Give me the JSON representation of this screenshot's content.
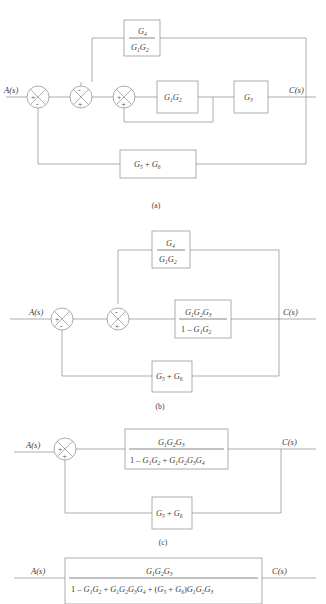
{
  "figure": {
    "title_cut": "",
    "panels": [
      {
        "id": "a",
        "caption": "(a)",
        "input_label": "A(s)",
        "output_label": "C(s)",
        "blocks": [
          {
            "name": "feedforward-ratio-block",
            "numerator": "G4",
            "denominator": "G1G2",
            "type": "fraction"
          },
          {
            "name": "g1g2-block",
            "text": "G1G2",
            "type": "plain"
          },
          {
            "name": "g3-block",
            "text": "G3",
            "type": "plain"
          },
          {
            "name": "g5g6-block",
            "text": "G5 + G6",
            "type": "plain"
          }
        ],
        "summers": [
          {
            "name": "summer-1",
            "left": "+",
            "bottom": "-"
          },
          {
            "name": "summer-2",
            "top": "-",
            "bottom": "+"
          },
          {
            "name": "summer-3",
            "left": "+",
            "bottom": "+"
          }
        ]
      },
      {
        "id": "b",
        "caption": "(b)",
        "input_label": "A(s)",
        "output_label": "C(s)",
        "blocks": [
          {
            "name": "feedforward-ratio-block",
            "numerator": "G4",
            "denominator": "G1G2",
            "type": "fraction"
          },
          {
            "name": "forward-path-block",
            "numerator": "G1G2G3",
            "denominator": "1 - G1G2",
            "type": "fraction"
          },
          {
            "name": "g5g6-block",
            "text": "G5 + G6",
            "type": "plain"
          }
        ],
        "summers": [
          {
            "name": "summer-1",
            "left": "+",
            "bottom": "-"
          },
          {
            "name": "summer-2",
            "top": "-",
            "bottom": "+"
          }
        ]
      },
      {
        "id": "c",
        "caption": "(c)",
        "input_label": "A(s)",
        "output_label": "C(s)",
        "blocks": [
          {
            "name": "forward-path-block",
            "numerator": "G1G2G3",
            "denominator": "1 - G1G2 + G1G2G3G4",
            "type": "fraction"
          },
          {
            "name": "g5g6-block",
            "text": "G5 + G6",
            "type": "plain"
          }
        ],
        "summers": [
          {
            "name": "summer-1",
            "left": "+",
            "bottom": "+"
          }
        ]
      },
      {
        "id": "d",
        "caption": "",
        "input_label": "A(s)",
        "output_label": "C(s)",
        "blocks": [
          {
            "name": "overall-transfer-function-block",
            "numerator": "G1G2G3",
            "denominator": "1 - G1G2 + G1G2G3G4 + (G5 + G6)G1G2G3",
            "type": "fraction"
          }
        ],
        "summers": []
      }
    ],
    "colors": {
      "line": "#8a8a8a",
      "text": "#3a3a3a",
      "background": "#ffffff"
    }
  }
}
